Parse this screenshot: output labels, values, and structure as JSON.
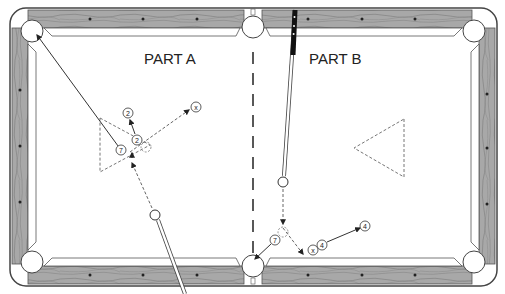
{
  "diagram": {
    "type": "pool-table-shot-diagram",
    "part_a": {
      "label": "PART A",
      "balls": [
        {
          "id": "ball-2-target",
          "number": "2",
          "x": 128,
          "y": 113
        },
        {
          "id": "ball-2-start",
          "number": "2",
          "x": 137,
          "y": 140
        },
        {
          "id": "ball-7",
          "number": "7",
          "x": 121,
          "y": 150
        },
        {
          "id": "ball-x",
          "number": "x",
          "x": 196,
          "y": 107
        }
      ],
      "cue_ball": {
        "x": 155,
        "y": 215
      }
    },
    "part_b": {
      "label": "PART B",
      "balls": [
        {
          "id": "ball-7",
          "number": "7",
          "x": 275,
          "y": 240
        },
        {
          "id": "ball-x",
          "number": "x",
          "x": 313,
          "y": 250
        },
        {
          "id": "ball-4-start",
          "number": "4",
          "x": 322,
          "y": 245
        },
        {
          "id": "ball-4-target",
          "number": "4",
          "x": 365,
          "y": 226
        }
      ],
      "cue_ball": {
        "x": 283,
        "y": 182
      }
    },
    "colors": {
      "rail_wood": "#9a9a9a",
      "rail_dark": "#555555",
      "felt": "#ffffff",
      "line": "#333333",
      "dashed": "#666666"
    }
  }
}
